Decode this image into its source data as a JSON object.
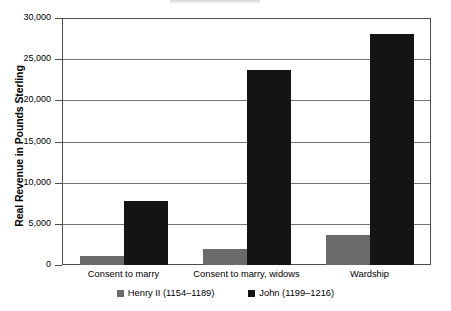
{
  "chart_data": {
    "type": "bar",
    "title": "",
    "subtitle": "",
    "xlabel": "",
    "ylabel": "Real Revenue in Pounds Sterling",
    "categories": [
      "Consent to marry",
      "Consent to marry, widows",
      "Wardship"
    ],
    "series": [
      {
        "name": "Henry II (1154–1189)",
        "color": "#6b6b6b",
        "values": [
          1100,
          2000,
          3700
        ]
      },
      {
        "name": "John (1199–1216)",
        "color": "#141414",
        "values": [
          7800,
          23700,
          28000
        ]
      }
    ],
    "ylim": [
      0,
      30000
    ],
    "ytick_values": [
      30000,
      25000,
      20000,
      15000,
      10000,
      5000,
      0
    ],
    "ytick_labels": [
      "30,000",
      "25,000",
      "20,000",
      "15,000",
      "10,000",
      "5,000",
      "0"
    ],
    "grid": true,
    "grid_axis": "y",
    "legend_position": "bottom",
    "orientation": "vertical",
    "grouping": "grouped"
  }
}
